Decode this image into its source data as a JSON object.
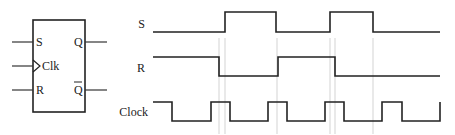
{
  "flipflop": {
    "inputs": [
      {
        "label": "S",
        "pin": "S"
      },
      {
        "label": "Clk",
        "pin": "Clk"
      },
      {
        "label": "R",
        "pin": "R"
      }
    ],
    "outputs": [
      {
        "label": "Q",
        "pin": "Q"
      },
      {
        "label": "Q",
        "pin": "Q-bar",
        "overbar": true
      }
    ]
  },
  "timing": {
    "signals": [
      {
        "name": "S",
        "label": "S"
      },
      {
        "name": "R",
        "label": "R"
      },
      {
        "name": "Clock",
        "label": "Clock"
      }
    ]
  },
  "colors": {
    "line": "#222222",
    "guide": "#c8c8c8",
    "background": "#ffffff"
  }
}
